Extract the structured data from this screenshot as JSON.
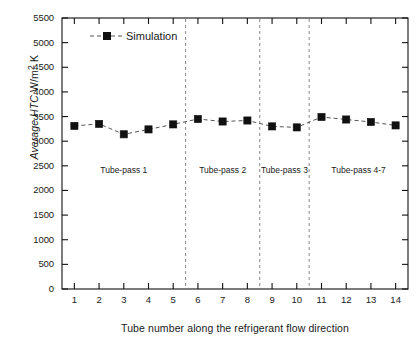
{
  "chart_data": {
    "type": "line",
    "title": "",
    "xlabel": "Tube number along the refrigerant flow direction",
    "ylabel": "Average HTC W/m2 K",
    "ylabel_parts": {
      "italic": "Average HTC",
      "unit_main": "W/m",
      "unit_sup": "2",
      "unit_tail": " K"
    },
    "x": [
      1,
      2,
      3,
      4,
      5,
      6,
      7,
      8,
      9,
      10,
      11,
      12,
      13,
      14
    ],
    "xtick_labels": [
      "1",
      "2",
      "3",
      "4",
      "5",
      "6",
      "7",
      "8",
      "9",
      "10",
      "11",
      "12",
      "13",
      "14"
    ],
    "ytick_labels": [
      "0",
      "500",
      "1000",
      "1500",
      "2000",
      "2500",
      "3000",
      "3500",
      "4000",
      "4500",
      "5000",
      "5500"
    ],
    "yticks": [
      0,
      500,
      1000,
      1500,
      2000,
      2500,
      3000,
      3500,
      4000,
      4500,
      5000,
      5500
    ],
    "xlim": [
      0.5,
      14.5
    ],
    "ylim": [
      0,
      5500
    ],
    "grid": false,
    "series": [
      {
        "name": "Simulation",
        "marker": "filled-square",
        "color": "#000000",
        "linestyle": "dashed",
        "values": [
          3310,
          3350,
          3140,
          3240,
          3340,
          3450,
          3400,
          3420,
          3300,
          3280,
          3490,
          3440,
          3390,
          3320
        ]
      }
    ],
    "legend": {
      "position": "top-left-inside",
      "entries": [
        "Simulation"
      ]
    },
    "annotations": [
      {
        "text": "Tube-pass 1",
        "x": 3.0,
        "y": 2400
      },
      {
        "text": "Tube-pass 2",
        "x": 7.0,
        "y": 2400
      },
      {
        "text": "Tube-pass 3",
        "x": 9.5,
        "y": 2400
      },
      {
        "text": "Tube-pass 4-7",
        "x": 12.5,
        "y": 2400
      }
    ],
    "vlines": [
      {
        "x": 5.5,
        "style": "dashed",
        "color": "#888888"
      },
      {
        "x": 8.5,
        "style": "dashed",
        "color": "#888888"
      },
      {
        "x": 10.5,
        "style": "dashed",
        "color": "#888888"
      }
    ]
  }
}
